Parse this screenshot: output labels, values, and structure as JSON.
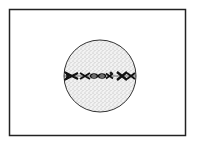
{
  "diagram": {
    "frame": {
      "x": 9,
      "y": 9,
      "width": 177,
      "height": 127,
      "stroke": "#222222"
    },
    "cell": {
      "cx": 100,
      "cy": 76,
      "r": 36,
      "stroke": "#333333",
      "stipple": "#555555"
    },
    "chromosomes": {
      "arrangement": "aligned along metaphase plate (equator)",
      "count_visible": 6,
      "color": "#1a1a1a"
    }
  }
}
